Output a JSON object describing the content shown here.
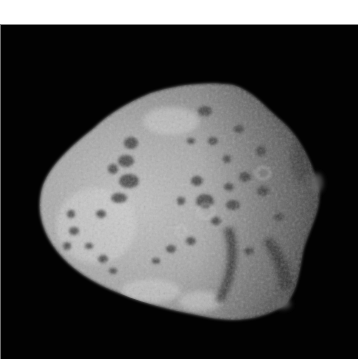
{
  "image": {
    "subject": "irregular cratered moon / asteroid",
    "description": "Grayscale photograph of a lumpy, cratered rocky body against a black sky",
    "colors": {
      "background_top": "#ffffff",
      "sky": "#020202",
      "border": "#7a7a7a",
      "surface_light": "#c4c4c4",
      "surface_mid": "#8f8f8f",
      "surface_dark": "#3a3a3a"
    }
  }
}
